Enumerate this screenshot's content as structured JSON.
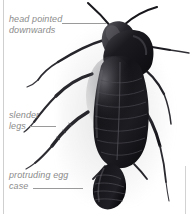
{
  "figure": {
    "background_color": "#ffffff",
    "rule_color": "#cfcfcf"
  },
  "annotations": {
    "label_color": "#8b8b8b",
    "leader_color": "#9a9a9a",
    "items": [
      {
        "id": "head",
        "text": "head pointed\ndownwards",
        "points_to": "head"
      },
      {
        "id": "legs",
        "text": "slender\nlegs",
        "points_to": "leg"
      },
      {
        "id": "egg_case",
        "text": "protruding egg\ncase",
        "points_to": "ootheca"
      }
    ]
  },
  "specimen": {
    "body_color": "#17161a",
    "highlight_color": "#6e6e74",
    "parts": [
      "antenna-left",
      "antenna-right",
      "head",
      "pronotum",
      "wing-plates",
      "abdomen",
      "ootheca",
      "leg-front-left",
      "leg-mid-left",
      "leg-hind-left",
      "leg-front-right",
      "leg-mid-right",
      "leg-hind-right",
      "cercus-left",
      "cercus-right"
    ]
  }
}
